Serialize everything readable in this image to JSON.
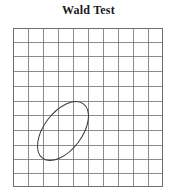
{
  "figure": {
    "title": "Wald Test",
    "background_color": "#ffffff"
  },
  "chart_data": {
    "type": "scatter",
    "title": "Wald Test",
    "subtitle": "",
    "xlabel": "",
    "ylabel": "",
    "tick_labels": {
      "x": [],
      "y": []
    },
    "legend": [],
    "legend_position": "none",
    "grid": true,
    "grid_columns": 10,
    "grid_rows": 11,
    "grid_color": "#6e6e6e",
    "grid_line_width": 0.7,
    "plot_box": {
      "x": 13,
      "y": 28,
      "width": 150,
      "height": 159
    },
    "annotations": [
      {
        "shape": "ellipse",
        "label": "confidence-region-ellipse",
        "center_x": 63,
        "center_y": 131,
        "semi_major": 34,
        "semi_minor": 19,
        "rotation_deg": -53,
        "stroke_color": "#3a3a3a",
        "stroke_width": 1.0,
        "fill": "none"
      }
    ],
    "axis_ranges": {
      "xlim": [
        0,
        10
      ],
      "ylim": [
        0,
        11
      ]
    },
    "series": [],
    "values": []
  }
}
